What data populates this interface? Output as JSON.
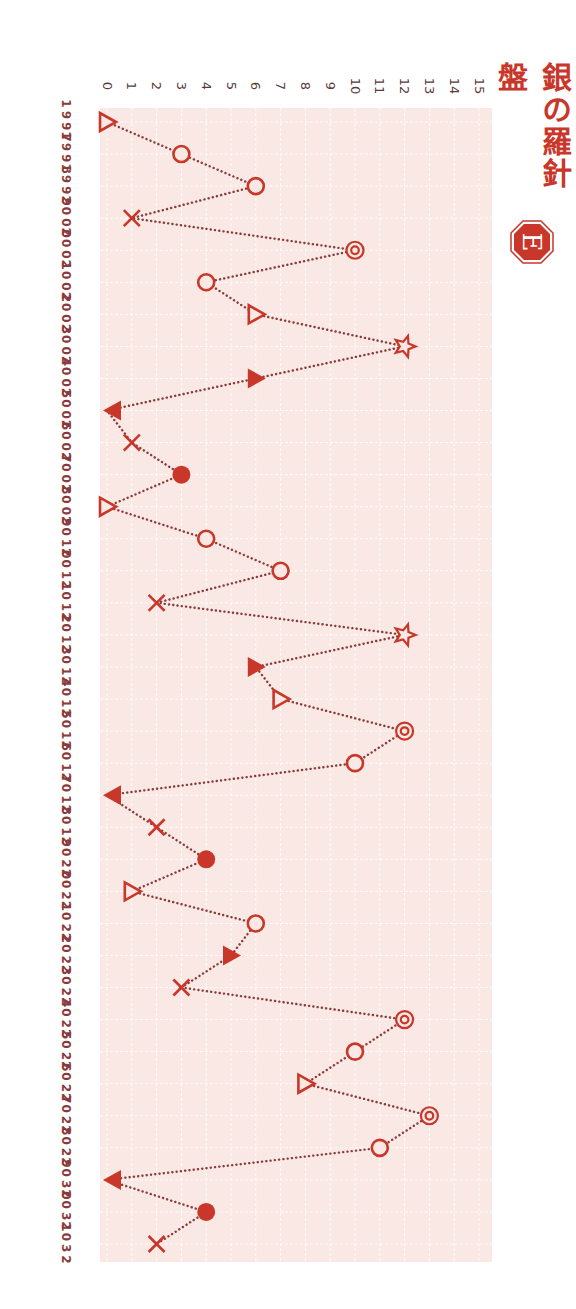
{
  "title": "銀の羅針盤",
  "badge": {
    "letter": "E",
    "color": "#c8372a"
  },
  "colors": {
    "marker": "#c8372a",
    "line": "#8b3a3a",
    "plot_bg": "#f9e8e3",
    "grid": "#ffffff",
    "label": "#5a3a3a",
    "year_label": "#8b3a3a"
  },
  "chart_data": {
    "type": "line",
    "title": "銀の羅針盤",
    "orientation": "rotated 90° clockwise (years run top-to-bottom, values increase left-to-right)",
    "xlabel": "Year",
    "ylabel": "",
    "ylim": [
      0,
      15
    ],
    "y_ticks": [
      0,
      1,
      2,
      3,
      4,
      5,
      6,
      7,
      8,
      9,
      10,
      11,
      12,
      13,
      14,
      15
    ],
    "grid": true,
    "line_style": "dotted",
    "legend": null,
    "marker_key": {
      "triangle-up-open": "△",
      "circle-open": "○",
      "cross": "×",
      "double-circle": "◎",
      "star-open": "☆",
      "triangle-up-filled": "▲",
      "triangle-down-filled": "▼",
      "circle-filled": "●"
    },
    "x": [
      1997,
      1998,
      1999,
      2000,
      2001,
      2002,
      2003,
      2004,
      2005,
      2006,
      2007,
      2008,
      2009,
      2010,
      2011,
      2012,
      2013,
      2014,
      2015,
      2016,
      2017,
      2018,
      2019,
      2020,
      2021,
      2022,
      2023,
      2024,
      2025,
      2026,
      2027,
      2028,
      2029,
      2030,
      2031,
      2032
    ],
    "series": [
      {
        "name": "銀の羅針盤",
        "values": [
          0,
          3,
          6,
          1,
          10,
          4,
          6,
          12,
          6,
          0,
          1,
          3,
          0,
          4,
          7,
          2,
          12,
          6,
          7,
          12,
          10,
          0,
          2,
          4,
          1,
          6,
          5,
          3,
          12,
          10,
          8,
          13,
          11,
          0,
          4,
          2
        ],
        "markers": [
          "triangle-up-open",
          "circle-open",
          "circle-open",
          "cross",
          "double-circle",
          "circle-open",
          "triangle-up-open",
          "star-open",
          "triangle-up-filled",
          "triangle-down-filled",
          "cross",
          "circle-filled",
          "triangle-up-open",
          "circle-open",
          "circle-open",
          "cross",
          "star-open",
          "triangle-up-filled",
          "triangle-up-open",
          "double-circle",
          "circle-open",
          "triangle-down-filled",
          "cross",
          "circle-filled",
          "triangle-up-open",
          "circle-open",
          "triangle-up-filled",
          "cross",
          "double-circle",
          "circle-open",
          "triangle-up-open",
          "double-circle",
          "circle-open",
          "triangle-down-filled",
          "circle-filled",
          "cross"
        ]
      }
    ]
  }
}
